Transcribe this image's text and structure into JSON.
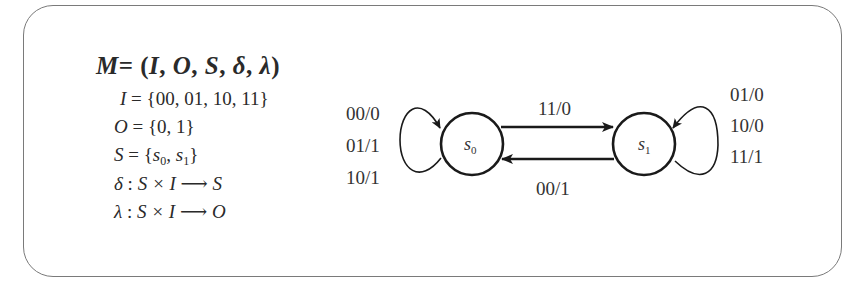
{
  "definition": {
    "tuple": {
      "name": "M",
      "equals": "=",
      "open": "(",
      "elements": [
        "I",
        "O",
        "S",
        "δ",
        "λ"
      ],
      "separator": ", ",
      "close": ")"
    },
    "lines": [
      {
        "lhs": "I",
        "rhs": "= {00, 01, 10, 11}"
      },
      {
        "lhs": "O",
        "rhs": "= {0, 1}"
      },
      {
        "lhs": "S",
        "rhs_prefix": "= {",
        "s0": "s",
        "s0_sub": "0",
        "sep": ", ",
        "s1": "s",
        "s1_sub": "1",
        "rhs_suffix": "}"
      },
      {
        "lhs": "δ",
        "colon": " : ",
        "domain": "S × I",
        "arrow": "⟶",
        "codomain": "S"
      },
      {
        "lhs": "λ",
        "colon": " : ",
        "domain": "S × I",
        "arrow": "⟶",
        "codomain": "O"
      }
    ]
  },
  "diagram": {
    "states": [
      {
        "id": "s0",
        "label": "s",
        "sub": "0"
      },
      {
        "id": "s1",
        "label": "s",
        "sub": "1"
      }
    ],
    "transitions": {
      "s0_to_s1": "11/0",
      "s1_to_s0": "00/1",
      "s0_self": [
        "00/0",
        "01/1",
        "10/1"
      ],
      "s1_self": [
        "01/0",
        "10/0",
        "11/1"
      ]
    },
    "colors": {
      "stroke": "#1a1a1a",
      "text": "#333333",
      "frame": "#7a7a7a"
    }
  }
}
